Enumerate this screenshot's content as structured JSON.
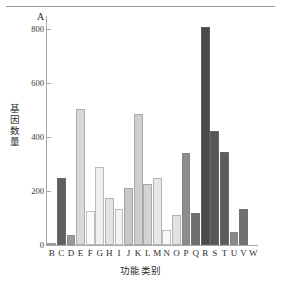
{
  "figure": {
    "panel_label": "A",
    "y_axis_title": "基因数量",
    "x_axis_title": "功能类别"
  },
  "chart_data": {
    "type": "bar",
    "title": "A",
    "xlabel": "功能类别",
    "ylabel": "基因数量",
    "ylim": [
      0,
      850
    ],
    "yticks": [
      0,
      200,
      400,
      600,
      800
    ],
    "ytick_labels": [
      "0",
      "200",
      "400",
      "600",
      "800"
    ],
    "grid": false,
    "legend": "none",
    "categories": [
      "B",
      "C",
      "D",
      "E",
      "F",
      "G",
      "H",
      "I",
      "J",
      "K",
      "L",
      "M",
      "N",
      "O",
      "P",
      "Q",
      "R",
      "S",
      "T",
      "U",
      "V",
      "W"
    ],
    "values": [
      4,
      248,
      38,
      505,
      125,
      290,
      175,
      133,
      213,
      485,
      225,
      250,
      57,
      113,
      342,
      120,
      808,
      425,
      345,
      50,
      135,
      0
    ],
    "bar_colors": [
      "#b9b9b9",
      "#5f5f5f",
      "#9a9a9a",
      "#d9d9d9",
      "#fbfbfb",
      "#efefef",
      "#e3e3e3",
      "#f2f2f2",
      "#c9c9c9",
      "#cfcfcf",
      "#d4d4d4",
      "#e8e8e8",
      "#f7f7f7",
      "#e2e2e2",
      "#8d8d8d",
      "#6f6f6f",
      "#4a4a4a",
      "#565656",
      "#5c5c5c",
      "#8a8a8a",
      "#707070",
      "#ffffff"
    ]
  }
}
